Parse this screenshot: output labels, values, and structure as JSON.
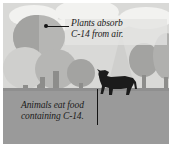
{
  "figure": {
    "palette": {
      "sky": "#d9d9d7",
      "ground": "#9a9a9a",
      "cloud": "#f2f2f0",
      "tree_light": "#cfcfcd",
      "tree_mid": "#b6b6b4",
      "tree_dark": "#a3a3a1",
      "trunk": "#8d8d8b",
      "cow": "#1b1b1b",
      "text": "#1a1a1a",
      "border": "#ffffff"
    }
  },
  "annotations": {
    "top": {
      "line1": "Plants absorb",
      "line2": "C-14 from air.",
      "icon": "leader-line-with-dot"
    },
    "bottom": {
      "line1": "Animals eat food",
      "line2": "containing C-14.",
      "icon": "leader-line-vertical"
    }
  },
  "scene": {
    "clouds": [
      {
        "name": "cloud-left",
        "x": 10,
        "y": 4,
        "w": 46,
        "h": 20
      },
      {
        "name": "cloud-center",
        "x": 55,
        "y": 0,
        "w": 60,
        "h": 24
      },
      {
        "name": "cloud-right",
        "x": 118,
        "y": 6,
        "w": 46,
        "h": 20
      },
      {
        "name": "cloud-small",
        "x": 92,
        "y": 14,
        "w": 34,
        "h": 14
      }
    ],
    "trees": [
      {
        "name": "tree-big-left",
        "type": "round",
        "x": 12,
        "y": 14,
        "w": 48,
        "h": 42,
        "tone": "tree_mid"
      },
      {
        "name": "tree-big-left-hi",
        "type": "round",
        "x": 12,
        "y": 14,
        "w": 26,
        "h": 42,
        "tone": "tree_dark"
      },
      {
        "name": "tree-lower-left",
        "type": "round",
        "x": 2,
        "y": 46,
        "w": 42,
        "h": 40,
        "tone": "tree_light"
      },
      {
        "name": "tree-mid-left",
        "type": "round",
        "x": 33,
        "y": 47,
        "w": 40,
        "h": 38,
        "tone": "tree_mid"
      },
      {
        "name": "tree-small-mid",
        "type": "round",
        "x": 64,
        "y": 56,
        "w": 26,
        "h": 26,
        "tone": "tree_dark"
      },
      {
        "name": "tree-conifer-right",
        "type": "conifer",
        "x": 108,
        "y": 36,
        "w": 26,
        "h": 48,
        "tone": "tree_light"
      },
      {
        "name": "tree-round-right",
        "type": "round",
        "x": 128,
        "y": 42,
        "w": 30,
        "h": 34,
        "tone": "tree_dark"
      },
      {
        "name": "tree-edge-right",
        "type": "round",
        "x": 150,
        "y": 30,
        "w": 22,
        "h": 44,
        "tone": "tree_mid"
      }
    ],
    "animal": {
      "name": "cow",
      "x": 92,
      "y": 66,
      "w": 44,
      "h": 25
    }
  }
}
